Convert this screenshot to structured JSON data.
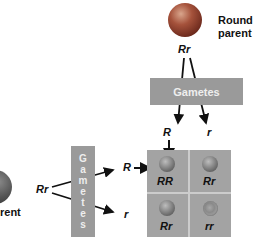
{
  "top_parent": {
    "label_line1": "Round",
    "label_line2": "parent",
    "genotype": "Rr"
  },
  "left_parent": {
    "label_partial": "rent",
    "genotype": "Rr"
  },
  "top_gametes": {
    "label": "Gametes",
    "alleles": [
      "R",
      "r"
    ]
  },
  "left_gametes": {
    "label_vertical": [
      "G",
      "a",
      "m",
      "e",
      "t",
      "e",
      "s"
    ],
    "alleles": [
      "R",
      "r"
    ]
  },
  "punnett_square": {
    "cells": [
      {
        "genotype": "RR",
        "phenotype": "round"
      },
      {
        "genotype": "Rr",
        "phenotype": "round"
      },
      {
        "genotype": "Rr",
        "phenotype": "round"
      },
      {
        "genotype": "rr",
        "phenotype": "wrinkled"
      }
    ]
  },
  "colors": {
    "bar": "#9a9a9a",
    "grid": "#a3a3a3",
    "pea_top": "#8f3b2a",
    "pea_cell": "#7a7a7a"
  }
}
